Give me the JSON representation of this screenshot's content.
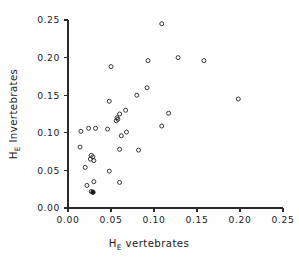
{
  "chart_data": {
    "type": "scatter",
    "title": "",
    "xlabel": "H_E vertebrates",
    "xlabel_main": "H",
    "xlabel_sub": "E",
    "xlabel_rest": "vertebrates",
    "ylabel": "H_E Invertebrates",
    "ylabel_main": "H",
    "ylabel_sub": "E",
    "ylabel_rest": "Invertebrates",
    "xlim": [
      0.0,
      0.25
    ],
    "ylim": [
      0.0,
      0.25
    ],
    "xticks": [
      0.0,
      0.05,
      0.1,
      0.15,
      0.2,
      0.25
    ],
    "yticks": [
      0.0,
      0.05,
      0.1,
      0.15,
      0.2,
      0.25
    ],
    "xtick_labels": [
      "0.00",
      "0.05",
      "0.10",
      "0.15",
      "0.20",
      "0.25"
    ],
    "ytick_labels": [
      "0.00",
      "0.05",
      "0.10",
      "0.15",
      "0.20",
      "0.25"
    ],
    "grid": false,
    "legend": null,
    "marker": "open-circle",
    "marker_color": "#2d2d2d",
    "points": [
      {
        "x": 0.109,
        "y": 0.245,
        "style": "open"
      },
      {
        "x": 0.128,
        "y": 0.2,
        "style": "open"
      },
      {
        "x": 0.093,
        "y": 0.196,
        "style": "open"
      },
      {
        "x": 0.158,
        "y": 0.196,
        "style": "open"
      },
      {
        "x": 0.05,
        "y": 0.188,
        "style": "open"
      },
      {
        "x": 0.092,
        "y": 0.16,
        "style": "open"
      },
      {
        "x": 0.08,
        "y": 0.15,
        "style": "open"
      },
      {
        "x": 0.198,
        "y": 0.145,
        "style": "open"
      },
      {
        "x": 0.048,
        "y": 0.142,
        "style": "open"
      },
      {
        "x": 0.067,
        "y": 0.13,
        "style": "open"
      },
      {
        "x": 0.117,
        "y": 0.126,
        "style": "open"
      },
      {
        "x": 0.06,
        "y": 0.125,
        "style": "open"
      },
      {
        "x": 0.057,
        "y": 0.12,
        "style": "open"
      },
      {
        "x": 0.058,
        "y": 0.118,
        "style": "open"
      },
      {
        "x": 0.056,
        "y": 0.116,
        "style": "open"
      },
      {
        "x": 0.109,
        "y": 0.109,
        "style": "open"
      },
      {
        "x": 0.024,
        "y": 0.106,
        "style": "open"
      },
      {
        "x": 0.032,
        "y": 0.106,
        "style": "open"
      },
      {
        "x": 0.046,
        "y": 0.105,
        "style": "open"
      },
      {
        "x": 0.015,
        "y": 0.102,
        "style": "open"
      },
      {
        "x": 0.068,
        "y": 0.101,
        "style": "open"
      },
      {
        "x": 0.062,
        "y": 0.096,
        "style": "open"
      },
      {
        "x": 0.014,
        "y": 0.081,
        "style": "open"
      },
      {
        "x": 0.06,
        "y": 0.078,
        "style": "open"
      },
      {
        "x": 0.082,
        "y": 0.077,
        "style": "open"
      },
      {
        "x": 0.027,
        "y": 0.07,
        "style": "open"
      },
      {
        "x": 0.029,
        "y": 0.068,
        "style": "open"
      },
      {
        "x": 0.026,
        "y": 0.065,
        "style": "open"
      },
      {
        "x": 0.03,
        "y": 0.063,
        "style": "open"
      },
      {
        "x": 0.02,
        "y": 0.054,
        "style": "open"
      },
      {
        "x": 0.048,
        "y": 0.049,
        "style": "open"
      },
      {
        "x": 0.03,
        "y": 0.035,
        "style": "open"
      },
      {
        "x": 0.06,
        "y": 0.034,
        "style": "open"
      },
      {
        "x": 0.022,
        "y": 0.03,
        "style": "open"
      },
      {
        "x": 0.027,
        "y": 0.022,
        "style": "open"
      },
      {
        "x": 0.029,
        "y": 0.021,
        "style": "filled"
      }
    ],
    "n_points": 36
  }
}
